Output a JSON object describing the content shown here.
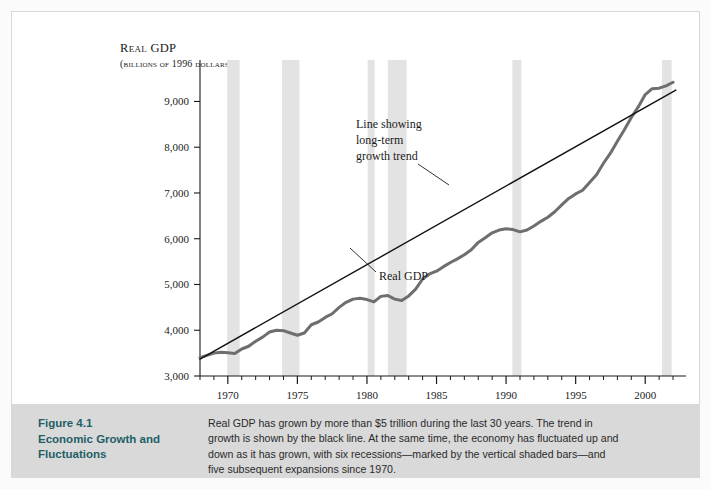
{
  "figure": {
    "caption_title_lines": [
      "Figure 4.1",
      "Economic Growth and",
      "Fluctuations"
    ],
    "caption_body_lines": [
      "Real GDP has grown by more than $5 trillion during the last 30 years. The trend in",
      "growth is shown by the black line. At the same time, the economy has fluctuated up and",
      "down as it has grown, with six recessions—marked by the vertical shaded bars—and",
      "five subsequent expansions since 1970."
    ],
    "caption_title_color": "#1f5f66",
    "caption_band_color": "#d9d9d9"
  },
  "chart_data": {
    "type": "line",
    "title": "",
    "ylabel": "Real GDP",
    "ylabel_sub": "(billions of 1996 dollars)",
    "xlabel": "",
    "xlim": [
      1968,
      2002.5
    ],
    "ylim": [
      3000,
      9600
    ],
    "ytick_values": [
      3000,
      4000,
      5000,
      6000,
      7000,
      8000,
      9000
    ],
    "ytick_labels": [
      "3,000",
      "4,000",
      "5,000",
      "6,000",
      "7,000",
      "8,000",
      "9,000"
    ],
    "xtick_major_values": [
      1970,
      1975,
      1980,
      1985,
      1990,
      1995,
      2000
    ],
    "xtick_major_labels": [
      "1970",
      "1975",
      "1980",
      "1985",
      "1990",
      "1995",
      "2000"
    ],
    "xtick_minor_step": 1,
    "grid": false,
    "legend_position": "none",
    "series": [
      {
        "name": "Real GDP",
        "color": "#6e6e6e",
        "width": 3,
        "x": [
          1968.0,
          1968.5,
          1969.0,
          1969.5,
          1970.0,
          1970.5,
          1971.0,
          1971.5,
          1972.0,
          1972.5,
          1973.0,
          1973.5,
          1974.0,
          1974.5,
          1975.0,
          1975.5,
          1976.0,
          1976.5,
          1977.0,
          1977.5,
          1978.0,
          1978.5,
          1979.0,
          1979.5,
          1980.0,
          1980.5,
          1981.0,
          1981.5,
          1982.0,
          1982.5,
          1983.0,
          1983.5,
          1984.0,
          1984.5,
          1985.0,
          1985.5,
          1986.0,
          1986.5,
          1987.0,
          1987.5,
          1988.0,
          1988.5,
          1989.0,
          1989.5,
          1990.0,
          1990.5,
          1991.0,
          1991.5,
          1992.0,
          1992.5,
          1993.0,
          1993.5,
          1994.0,
          1994.5,
          1995.0,
          1995.5,
          1996.0,
          1996.5,
          1997.0,
          1997.5,
          1998.0,
          1998.5,
          1999.0,
          1999.5,
          2000.0,
          2000.5,
          2001.0,
          2001.5,
          2002.0
        ],
        "y": [
          3400,
          3450,
          3500,
          3520,
          3510,
          3490,
          3590,
          3650,
          3760,
          3850,
          3960,
          4000,
          3990,
          3940,
          3890,
          3940,
          4120,
          4180,
          4280,
          4360,
          4500,
          4610,
          4680,
          4700,
          4670,
          4620,
          4740,
          4760,
          4680,
          4650,
          4750,
          4900,
          5120,
          5230,
          5290,
          5390,
          5480,
          5560,
          5650,
          5760,
          5920,
          6020,
          6130,
          6190,
          6220,
          6200,
          6150,
          6190,
          6280,
          6380,
          6470,
          6590,
          6740,
          6880,
          6980,
          7060,
          7230,
          7400,
          7650,
          7870,
          8130,
          8380,
          8650,
          8880,
          9150,
          9280,
          9290,
          9340,
          9420
        ]
      },
      {
        "name": "Line showing long-term growth trend",
        "color": "#111111",
        "width": 1.4,
        "trend": true,
        "x": [
          1968.0,
          2002.2
        ],
        "y": [
          3370,
          9250
        ]
      }
    ],
    "recessions": [
      {
        "label": "1969-1970",
        "start": 1969.95,
        "end": 1970.85
      },
      {
        "label": "1973-1975",
        "start": 1973.9,
        "end": 1975.15
      },
      {
        "label": "1980",
        "start": 1980.05,
        "end": 1980.55
      },
      {
        "label": "1981-1982",
        "start": 1981.5,
        "end": 1982.85
      },
      {
        "label": "1990-1991",
        "start": 1990.45,
        "end": 1991.1
      },
      {
        "label": "2001",
        "start": 2001.2,
        "end": 2001.9
      }
    ],
    "recession_color": "#e3e3e3",
    "annotations": [
      {
        "name": "trend-annotation",
        "lines": [
          "Line showing",
          "long-term",
          "growth trend"
        ],
        "text_x": 344,
        "text_y": 116,
        "leader_from_x": 406,
        "leader_from_y": 152,
        "leader_to_x": 437,
        "leader_to_y": 173
      },
      {
        "name": "real-gdp-annotation",
        "lines": [
          "Real GDP"
        ],
        "text_x": 367,
        "text_y": 268,
        "leader_from_x": 364,
        "leader_from_y": 260,
        "leader_to_x": 338,
        "leader_to_y": 236
      }
    ]
  }
}
